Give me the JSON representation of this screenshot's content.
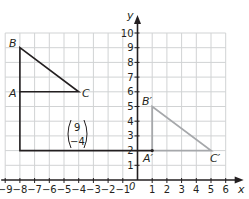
{
  "diagram": {
    "type": "coordinate-grid-translation",
    "axes": {
      "x_label": "x",
      "y_label": "y",
      "origin_label": "0",
      "x_ticks": [
        "-9",
        "-8",
        "-7",
        "-6",
        "-5",
        "-4",
        "-3",
        "-2",
        "-1",
        "1",
        "2",
        "3",
        "4",
        "5",
        "6"
      ],
      "y_ticks": [
        "1",
        "2",
        "3",
        "4",
        "5",
        "6",
        "7",
        "8",
        "9",
        "10"
      ],
      "x_range": [
        -9,
        6
      ],
      "y_range": [
        0,
        10
      ]
    },
    "original_triangle": {
      "color": "#231f20",
      "vertices": [
        {
          "name": "A",
          "x": -8,
          "y": 6
        },
        {
          "name": "B",
          "x": -8,
          "y": 9
        },
        {
          "name": "C",
          "x": -4,
          "y": 6
        }
      ]
    },
    "image_triangle": {
      "color": "#a6a8ab",
      "vertices": [
        {
          "name": "A'",
          "x": 1,
          "y": 2
        },
        {
          "name": "B'",
          "x": 1,
          "y": 5
        },
        {
          "name": "C'",
          "x": 5,
          "y": 2
        }
      ]
    },
    "translation_path": {
      "color": "#231f20",
      "points": [
        {
          "x": -8,
          "y": 6
        },
        {
          "x": -8,
          "y": 2
        },
        {
          "x": 1,
          "y": 2
        }
      ]
    },
    "translation_vector": {
      "top": "9",
      "bottom": "−4"
    },
    "colors": {
      "grid": "#d1d3d4",
      "axis": "#231f20",
      "original": "#231f20",
      "image": "#a6a8ab"
    }
  },
  "labels": {
    "A": "A",
    "B": "B",
    "C": "C",
    "A_prime": "A′",
    "B_prime": "B′",
    "C_prime": "C′"
  }
}
